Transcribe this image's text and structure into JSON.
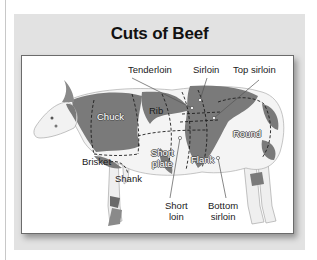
{
  "figure": {
    "title": "Cuts of Beef",
    "colors": {
      "panel_background": "#e2e2e2",
      "frame_background": "#ffffff",
      "cow_patch": "#7a7a7a",
      "cow_body": "#f4f4f4"
    },
    "labels": {
      "tenderloin": "Tenderloin",
      "sirloin": "Sirloin",
      "top_sirloin": "Top sirloin",
      "chuck": "Chuck",
      "rib": "Rib",
      "round": "Round",
      "brisket": "Brisket",
      "short_plate_1": "Short",
      "short_plate_2": "plate",
      "flank": "Flank",
      "shank": "Shank",
      "short_loin_1": "Short",
      "short_loin_2": "loin",
      "bottom_sirloin_1": "Bottom",
      "bottom_sirloin_2": "sirloin"
    }
  }
}
